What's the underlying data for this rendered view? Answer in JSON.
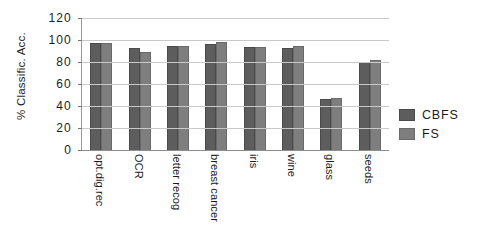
{
  "chart_data": {
    "type": "bar",
    "title": "",
    "xlabel": "",
    "ylabel": "% Classific. Acc.",
    "ylim": [
      0,
      120
    ],
    "yticks": [
      120,
      100,
      80,
      60,
      40,
      20,
      0
    ],
    "grid": true,
    "legend_position": "right",
    "categories": [
      "opt.dig.rec",
      "OCR",
      "letter recog",
      "breast cancer",
      "iris",
      "wine",
      "glass",
      "seeds"
    ],
    "series": [
      {
        "name": "CBFS",
        "color": "#5d5d5d",
        "values": [
          97.5,
          93,
          95,
          96,
          93.5,
          93,
          46,
          80
        ]
      },
      {
        "name": "FS",
        "color": "#7e7e7e",
        "values": [
          97.5,
          89.5,
          95,
          98,
          93.5,
          94.5,
          47.5,
          81.5
        ]
      }
    ]
  }
}
